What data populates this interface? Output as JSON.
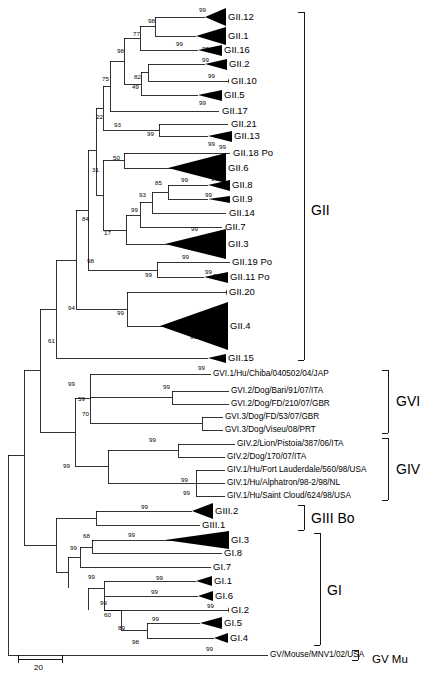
{
  "figure": {
    "type": "phylogenetic-tree",
    "kind": "rooted rectangular cladogram with collapsed triangle clades",
    "scale_bar": {
      "label": "20",
      "x": 18,
      "y": 663,
      "width": 44
    }
  },
  "taxa": [
    {
      "id": "GII.12",
      "label": "GII.12",
      "x": 228,
      "y": 17,
      "triangle": true,
      "tri_size": "large"
    },
    {
      "id": "GII.1",
      "label": "GII.1",
      "x": 228,
      "y": 36,
      "triangle": true,
      "tri_size": "large"
    },
    {
      "id": "GII.16",
      "label": "GII.16",
      "x": 224,
      "y": 50,
      "triangle": true,
      "tri_size": "small"
    },
    {
      "id": "GII.2",
      "label": "GII.2",
      "x": 229,
      "y": 64,
      "triangle": true,
      "tri_size": "small"
    },
    {
      "id": "GII.10",
      "label": "GII.10",
      "x": 231,
      "y": 81,
      "triangle": true,
      "tri_size": "tiny"
    },
    {
      "id": "GII.5",
      "label": "GII.5",
      "x": 224,
      "y": 95,
      "triangle": true,
      "tri_size": "small"
    },
    {
      "id": "GII.17",
      "label": "GII.17",
      "x": 222,
      "y": 111,
      "triangle": false
    },
    {
      "id": "GII.21",
      "label": "GII.21",
      "x": 231,
      "y": 124,
      "triangle": false
    },
    {
      "id": "GII.13",
      "label": "GII.13",
      "x": 234,
      "y": 136,
      "triangle": true,
      "tri_size": "small"
    },
    {
      "id": "GII.18",
      "label": "GII.18 Po",
      "x": 233,
      "y": 153,
      "triangle": false
    },
    {
      "id": "GII.6",
      "label": "GII.6",
      "x": 228,
      "y": 168,
      "triangle": true,
      "tri_size": "xlarge"
    },
    {
      "id": "GII.8",
      "label": "GII.8",
      "x": 232,
      "y": 185,
      "triangle": true,
      "tri_size": "small"
    },
    {
      "id": "GII.9",
      "label": "GII.9",
      "x": 232,
      "y": 199,
      "triangle": true,
      "tri_size": "tiny"
    },
    {
      "id": "GII.14",
      "label": "GII.14",
      "x": 229,
      "y": 213,
      "triangle": false
    },
    {
      "id": "GII.7",
      "label": "GII.7",
      "x": 225,
      "y": 227,
      "triangle": false
    },
    {
      "id": "GII.3",
      "label": "GII.3",
      "x": 228,
      "y": 244,
      "triangle": true,
      "tri_size": "xlarge"
    },
    {
      "id": "GII.19",
      "label": "GII.19 Po",
      "x": 232,
      "y": 262,
      "triangle": false
    },
    {
      "id": "GII.11",
      "label": "GII.11 Po",
      "x": 230,
      "y": 277,
      "triangle": true,
      "tri_size": "small"
    },
    {
      "id": "GII.20",
      "label": "GII.20",
      "x": 229,
      "y": 292,
      "triangle": true,
      "tri_size": "tiny"
    },
    {
      "id": "GII.4",
      "label": "GII.4",
      "x": 230,
      "y": 326,
      "triangle": true,
      "tri_size": "huge"
    },
    {
      "id": "GII.15",
      "label": "GII.15",
      "x": 228,
      "y": 358,
      "triangle": true,
      "tri_size": "small"
    },
    {
      "id": "GVI.1.Chiba",
      "label": "GVI.1/Hu/Chiba/040502/04/JAP",
      "x": 213,
      "y": 374,
      "triangle": false
    },
    {
      "id": "GVI.2.Bari",
      "label": "GVI.2/Dog/Bari/91/07/ITA",
      "x": 231,
      "y": 391,
      "triangle": false
    },
    {
      "id": "GVI.2.FD210",
      "label": "GVI.2/Dog/FD/210/07/GBR",
      "x": 231,
      "y": 404,
      "triangle": false
    },
    {
      "id": "GVI.3.FD53",
      "label": "GVI.3/Dog/FD/53/07/GBR",
      "x": 225,
      "y": 417,
      "triangle": false
    },
    {
      "id": "GVI.3.Viseu",
      "label": "GVI.3/Dog/Viseu/08/PRT",
      "x": 225,
      "y": 430,
      "triangle": false
    },
    {
      "id": "GIV.2.Lion",
      "label": "GIV.2/Lion/Pistoia/387/06/ITA",
      "x": 237,
      "y": 444,
      "triangle": false
    },
    {
      "id": "GIV.2.Dog170",
      "label": "GIV.2/Dog/170/07/ITA",
      "x": 227,
      "y": 457,
      "triangle": false
    },
    {
      "id": "GIV.1.Fort",
      "label": "GIV.1/Hu/Fort Lauderdale/560/98/USA",
      "x": 227,
      "y": 470,
      "triangle": false
    },
    {
      "id": "GIV.1.Alpha",
      "label": "GIV.1/Hu/Alphatron/98-2/98/NL",
      "x": 227,
      "y": 483,
      "triangle": false
    },
    {
      "id": "GIV.1.Saint",
      "label": "GIV.1/Hu/Saint Cloud/624/98/USA",
      "x": 227,
      "y": 496,
      "triangle": false
    },
    {
      "id": "GIII.2",
      "label": "GIII.2",
      "x": 215,
      "y": 511,
      "triangle": true,
      "tri_size": "large"
    },
    {
      "id": "GIII.1",
      "label": "GIII.1",
      "x": 202,
      "y": 525,
      "triangle": false
    },
    {
      "id": "GI.3",
      "label": "GI.3",
      "x": 231,
      "y": 540,
      "triangle": true,
      "tri_size": "xlarge"
    },
    {
      "id": "GI.8",
      "label": "GI.8",
      "x": 224,
      "y": 553,
      "triangle": false
    },
    {
      "id": "GI.7",
      "label": "GI.7",
      "x": 213,
      "y": 567,
      "triangle": false
    },
    {
      "id": "GI.1",
      "label": "GI.1",
      "x": 214,
      "y": 581,
      "triangle": true,
      "tri_size": "small"
    },
    {
      "id": "GI.6",
      "label": "GI.6",
      "x": 215,
      "y": 596,
      "triangle": true,
      "tri_size": "small"
    },
    {
      "id": "GI.2",
      "label": "GI.2",
      "x": 231,
      "y": 610,
      "triangle": true,
      "tri_size": "tiny"
    },
    {
      "id": "GI.5",
      "label": "GI.5",
      "x": 224,
      "y": 623,
      "triangle": true,
      "tri_size": "large"
    },
    {
      "id": "GI.4",
      "label": "GI.4",
      "x": 230,
      "y": 638,
      "triangle": true,
      "tri_size": "small"
    },
    {
      "id": "GV.MNV1",
      "label": "GV/Mouse/MNV1/02/USA",
      "x": 270,
      "y": 655,
      "triangle": false
    }
  ],
  "bootstrap_values": [
    {
      "value": "99",
      "x": 199,
      "y": 7
    },
    {
      "value": "98",
      "x": 148,
      "y": 18
    },
    {
      "value": "77",
      "x": 133,
      "y": 31
    },
    {
      "value": "99",
      "x": 176,
      "y": 41
    },
    {
      "value": "98",
      "x": 117,
      "y": 48
    },
    {
      "value": "99",
      "x": 202,
      "y": 46
    },
    {
      "value": "99",
      "x": 202,
      "y": 57
    },
    {
      "value": "75",
      "x": 102,
      "y": 76
    },
    {
      "value": "82",
      "x": 134,
      "y": 74
    },
    {
      "value": "99",
      "x": 208,
      "y": 73
    },
    {
      "value": "49",
      "x": 132,
      "y": 84
    },
    {
      "value": "99",
      "x": 199,
      "y": 100
    },
    {
      "value": "22",
      "x": 96,
      "y": 114
    },
    {
      "value": "93",
      "x": 114,
      "y": 122
    },
    {
      "value": "99",
      "x": 147,
      "y": 131
    },
    {
      "value": "99",
      "x": 208,
      "y": 141
    },
    {
      "value": "99",
      "x": 219,
      "y": 144
    },
    {
      "value": "50",
      "x": 113,
      "y": 155
    },
    {
      "value": "31",
      "x": 92,
      "y": 167
    },
    {
      "value": "99",
      "x": 181,
      "y": 177
    },
    {
      "value": "85",
      "x": 155,
      "y": 180
    },
    {
      "value": "99",
      "x": 211,
      "y": 176
    },
    {
      "value": "93",
      "x": 139,
      "y": 192
    },
    {
      "value": "99",
      "x": 205,
      "y": 192
    },
    {
      "value": "99",
      "x": 131,
      "y": 207
    },
    {
      "value": "84",
      "x": 82,
      "y": 216
    },
    {
      "value": "17",
      "x": 104,
      "y": 230
    },
    {
      "value": "99",
      "x": 191,
      "y": 226
    },
    {
      "value": "99",
      "x": 182,
      "y": 254
    },
    {
      "value": "98",
      "x": 87,
      "y": 258
    },
    {
      "value": "99",
      "x": 218,
      "y": 252
    },
    {
      "value": "99",
      "x": 145,
      "y": 272
    },
    {
      "value": "99",
      "x": 205,
      "y": 269
    },
    {
      "value": "99",
      "x": 213,
      "y": 273
    },
    {
      "value": "94",
      "x": 68,
      "y": 305
    },
    {
      "value": "99",
      "x": 117,
      "y": 310
    },
    {
      "value": "99",
      "x": 190,
      "y": 334
    },
    {
      "value": "61",
      "x": 48,
      "y": 338
    },
    {
      "value": "99",
      "x": 198,
      "y": 365
    },
    {
      "value": "99",
      "x": 68,
      "y": 381
    },
    {
      "value": "99",
      "x": 163,
      "y": 384
    },
    {
      "value": "59",
      "x": 78,
      "y": 396
    },
    {
      "value": "70",
      "x": 82,
      "y": 411
    },
    {
      "value": "99",
      "x": 149,
      "y": 437
    },
    {
      "value": "99",
      "x": 63,
      "y": 463
    },
    {
      "value": "99",
      "x": 181,
      "y": 477
    },
    {
      "value": "99",
      "x": 183,
      "y": 490
    },
    {
      "value": "99",
      "x": 141,
      "y": 504
    },
    {
      "value": "99",
      "x": 128,
      "y": 532
    },
    {
      "value": "68",
      "x": 83,
      "y": 533
    },
    {
      "value": "99",
      "x": 70,
      "y": 545
    },
    {
      "value": "99",
      "x": 156,
      "y": 575
    },
    {
      "value": "99",
      "x": 88,
      "y": 574
    },
    {
      "value": "99",
      "x": 151,
      "y": 589
    },
    {
      "value": "99",
      "x": 100,
      "y": 600
    },
    {
      "value": "60",
      "x": 104,
      "y": 612
    },
    {
      "value": "99",
      "x": 207,
      "y": 603
    },
    {
      "value": "99",
      "x": 152,
      "y": 616
    },
    {
      "value": "89",
      "x": 118,
      "y": 625
    },
    {
      "value": "98",
      "x": 132,
      "y": 639
    },
    {
      "value": "99",
      "x": 206,
      "y": 646
    }
  ],
  "group_brackets": [
    {
      "id": "GII",
      "label": "GII",
      "x1": 304,
      "y1": 12,
      "y2": 360,
      "label_x": 311,
      "label_y": 203,
      "size": "lg"
    },
    {
      "id": "GVI",
      "label": "GVI",
      "x1": 388,
      "y1": 370,
      "y2": 433,
      "label_x": 396,
      "label_y": 394,
      "size": "lg"
    },
    {
      "id": "GIV",
      "label": "GIV",
      "x1": 388,
      "y1": 438,
      "y2": 500,
      "label_x": 396,
      "label_y": 462,
      "size": "lg"
    },
    {
      "id": "GIIIBo",
      "label": "GIII Bo",
      "x1": 304,
      "y1": 505,
      "y2": 530,
      "label_x": 311,
      "label_y": 511,
      "size": "lg"
    },
    {
      "id": "GI",
      "label": "GI",
      "x1": 320,
      "y1": 533,
      "y2": 645,
      "label_x": 327,
      "label_y": 583,
      "size": "lg"
    },
    {
      "id": "GVMu",
      "label": "GV Mu",
      "x1": 358,
      "y1": 650,
      "y2": 660,
      "label_x": 372,
      "label_y": 652,
      "size": "sm"
    }
  ]
}
